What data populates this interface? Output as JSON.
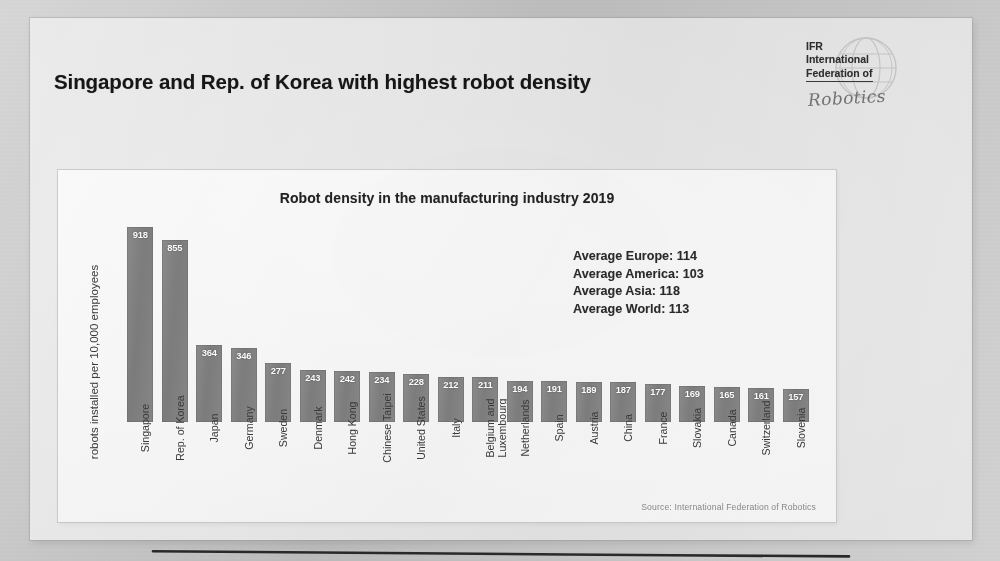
{
  "slide": {
    "title": "Singapore and Rep. of Korea with highest robot density"
  },
  "logo": {
    "line1": "IFR",
    "line2": "International",
    "line3": "Federation of",
    "script": "Robotics",
    "icon": "globe-icon"
  },
  "chart_panel": {
    "source": "Source: International Federation of Robotics"
  },
  "averages": {
    "europe": "Average Europe: 114",
    "america": "Average America: 103",
    "asia": "Average Asia: 118",
    "world": "Average World: 113"
  },
  "chart_data": {
    "type": "bar",
    "title": "Robot density in the manufacturing industry 2019",
    "xlabel": "",
    "ylabel": "robots installed per 10,000 employees",
    "ylim": [
      0,
      960
    ],
    "grid": false,
    "legend": "none",
    "bar_color": "#848484",
    "value_label_color": "#ffffff",
    "categories": [
      "Singapore",
      "Rep. of Korea",
      "Japan",
      "Germany",
      "Sweden",
      "Denmark",
      "Hong Kong",
      "Chinese Taipei",
      "United States",
      "Italy",
      "Belgium and Luxembourg",
      "Netherlands",
      "Spain",
      "Austria",
      "China",
      "France",
      "Slovakia",
      "Canada",
      "Switzerland",
      "Slovenia"
    ],
    "values": [
      918,
      855,
      364,
      346,
      277,
      243,
      242,
      234,
      228,
      212,
      211,
      194,
      191,
      189,
      187,
      177,
      169,
      165,
      161,
      157
    ],
    "annotations": [
      {
        "type": "trend-line",
        "label": "hand-drawn reference line across bars"
      },
      {
        "type": "text",
        "label": "Average Europe: 114"
      },
      {
        "type": "text",
        "label": "Average America: 103"
      },
      {
        "type": "text",
        "label": "Average Asia: 118"
      },
      {
        "type": "text",
        "label": "Average World: 113"
      }
    ]
  }
}
